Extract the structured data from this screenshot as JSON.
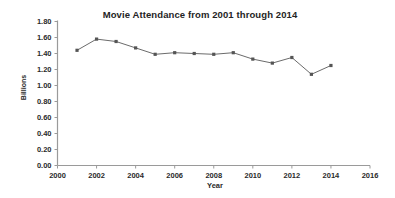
{
  "chart_data": {
    "type": "line",
    "title": "Movie Attendance from 2001 through 2014",
    "xlabel": "Year",
    "ylabel": "Billions",
    "x": [
      2001,
      2002,
      2003,
      2004,
      2005,
      2006,
      2007,
      2008,
      2009,
      2010,
      2011,
      2012,
      2013,
      2014
    ],
    "values": [
      1.44,
      1.58,
      1.55,
      1.47,
      1.39,
      1.41,
      1.4,
      1.39,
      1.41,
      1.33,
      1.28,
      1.35,
      1.14,
      1.25
    ],
    "series": [
      {
        "name": "Movie Attendance",
        "values": [
          1.44,
          1.58,
          1.55,
          1.47,
          1.39,
          1.41,
          1.4,
          1.39,
          1.41,
          1.33,
          1.28,
          1.35,
          1.14,
          1.25
        ]
      }
    ],
    "xlim": [
      2000,
      2016
    ],
    "ylim": [
      0.0,
      1.8
    ],
    "xticks": [
      2000,
      2002,
      2004,
      2006,
      2008,
      2010,
      2012,
      2014,
      2016
    ],
    "xtick_labels": [
      "2000",
      "2002",
      "2004",
      "2006",
      "2008",
      "2010",
      "2012",
      "2014",
      "2016"
    ],
    "yticks": [
      0.0,
      0.2,
      0.4,
      0.6,
      0.8,
      1.0,
      1.2,
      1.4,
      1.6,
      1.8
    ],
    "ytick_labels": [
      "0.00",
      "0.20",
      "0.40",
      "0.60",
      "0.80",
      "1.00",
      "1.20",
      "1.40",
      "1.60",
      "1.80"
    ],
    "grid": false,
    "legend": "none",
    "line_color": "#6b6b6b",
    "marker_color": "#555555",
    "axis_color": "#9a9a9a",
    "background_color": "#ffffff"
  }
}
